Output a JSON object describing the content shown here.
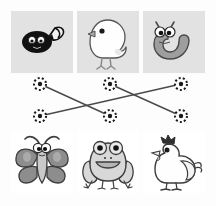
{
  "puzzle": {
    "title": "Life-cycle matching puzzle",
    "type": "match-the-pairs",
    "background_color": "#fdfdfd",
    "top_card_color": "#e2e2e2",
    "bottom_card_color": "#ffffff",
    "line_color": "#4a4a4a",
    "node_color": "#1a1a1a"
  },
  "top_row": {
    "label": "young / larval stage",
    "items": [
      {
        "id": "tadpole",
        "name": "tadpole",
        "icon": "tadpole-icon",
        "x": 11,
        "y": 11,
        "fill": "#111111",
        "detail": "black tadpole with white eyes and pale tail fin"
      },
      {
        "id": "chick",
        "name": "chick",
        "icon": "chick-icon",
        "x": 77,
        "y": 11,
        "fill": "#ffffff",
        "detail": "white fluffy chick with grey beak and legs"
      },
      {
        "id": "caterpillar",
        "name": "caterpillar",
        "icon": "caterpillar-icon",
        "x": 143,
        "y": 11,
        "fill": "#9a9a9a",
        "detail": "grey curved caterpillar with antennae and big eyes"
      }
    ]
  },
  "bottom_row": {
    "label": "adult stage",
    "items": [
      {
        "id": "butterfly",
        "name": "butterfly",
        "icon": "butterfly-icon",
        "x": 11,
        "y": 131,
        "fill": "#8c8c8c",
        "detail": "grey butterfly with spotted wings and antennae"
      },
      {
        "id": "frog",
        "name": "frog",
        "icon": "frog-icon",
        "x": 77,
        "y": 131,
        "fill": "#d6d6d6",
        "detail": "smiling grey-green frog sitting"
      },
      {
        "id": "hen",
        "name": "hen",
        "icon": "hen-icon",
        "x": 143,
        "y": 131,
        "fill": "#ffffff",
        "detail": "white hen with dark comb"
      }
    ]
  },
  "nodes": {
    "top": [
      {
        "id": "n-top-left",
        "x": 40,
        "y": 84
      },
      {
        "id": "n-top-mid",
        "x": 110,
        "y": 84
      },
      {
        "id": "n-top-right",
        "x": 181,
        "y": 84
      }
    ],
    "bottom": [
      {
        "id": "n-bottom-left",
        "x": 40,
        "y": 116
      },
      {
        "id": "n-bottom-mid",
        "x": 110,
        "y": 116
      },
      {
        "id": "n-bottom-right",
        "x": 181,
        "y": 116
      }
    ]
  },
  "connections": [
    {
      "id": "c1",
      "from": "tadpole",
      "to": "frog",
      "x1": 40,
      "y1": 84,
      "x2": 110,
      "y2": 116
    },
    {
      "id": "c2",
      "from": "chick",
      "to": "hen",
      "x1": 110,
      "y1": 84,
      "x2": 181,
      "y2": 116
    },
    {
      "id": "c3",
      "from": "caterpillar",
      "to": "butterfly",
      "x1": 181,
      "y1": 84,
      "x2": 40,
      "y2": 116
    }
  ]
}
